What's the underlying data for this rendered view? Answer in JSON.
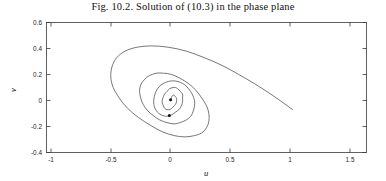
{
  "figure": {
    "title": "Fig. 10.2.  Solution of (10.3) in the phase plane",
    "xlabel": "u",
    "ylabel": "v"
  },
  "axes": {
    "x_ticks": [
      "-1",
      "-0.5",
      "0",
      "0.5",
      "1",
      "1.5"
    ],
    "y_ticks": [
      "0.6",
      "0.4",
      "0.2",
      "0",
      "-0.2",
      "-0.4"
    ]
  },
  "chart_data": {
    "type": "line",
    "title": "Fig. 10.2.  Solution of (10.3) in the phase plane",
    "xlabel": "u",
    "ylabel": "v",
    "xlim": [
      -1.1,
      1.6
    ],
    "ylim": [
      -0.45,
      0.6
    ],
    "grid": false,
    "legend": "none",
    "xticks": [
      -1,
      -0.5,
      0,
      0.5,
      1,
      1.5
    ],
    "yticks": [
      0.6,
      0.4,
      0.2,
      0,
      -0.2,
      -0.4
    ],
    "series": [
      {
        "name": "phase-plane trajectory",
        "description": "inward spiral orbit converging to the equilibrium at the origin",
        "x": [
          1.02,
          0.93,
          0.82,
          0.7,
          0.57,
          0.43,
          0.28,
          0.13,
          -0.02,
          -0.16,
          -0.28,
          -0.38,
          -0.45,
          -0.49,
          -0.5,
          -0.48,
          -0.43,
          -0.36,
          -0.27,
          -0.17,
          -0.07,
          0.03,
          0.12,
          0.2,
          0.26,
          0.3,
          0.32,
          0.32,
          0.3,
          0.26,
          0.21,
          0.15,
          0.08,
          0.01,
          -0.06,
          -0.12,
          -0.18,
          -0.22,
          -0.25,
          -0.26,
          -0.25,
          -0.23,
          -0.19,
          -0.14,
          -0.09,
          -0.03,
          0.03,
          0.08,
          0.13,
          0.17,
          0.19,
          0.2,
          0.2,
          0.18,
          0.15,
          0.12,
          0.08,
          0.04,
          0.0,
          -0.04,
          -0.08,
          -0.11,
          -0.13,
          -0.14,
          -0.14,
          -0.13,
          -0.11,
          -0.08,
          -0.05,
          -0.02,
          0.01,
          0.04,
          0.07,
          0.09,
          0.1,
          0.1,
          0.1,
          0.08,
          0.06,
          0.04,
          0.02,
          -0.01,
          -0.03,
          -0.05,
          -0.06,
          -0.07,
          -0.07,
          -0.06,
          -0.05,
          -0.03,
          -0.01,
          0.01,
          0.02,
          0.04,
          0.05,
          0.05,
          0.05,
          0.04,
          0.03,
          0.02,
          0.01,
          0.0
        ],
        "y": [
          -0.07,
          -0.01,
          0.06,
          0.13,
          0.2,
          0.27,
          0.33,
          0.38,
          0.41,
          0.42,
          0.41,
          0.38,
          0.33,
          0.26,
          0.18,
          0.1,
          0.02,
          -0.06,
          -0.13,
          -0.19,
          -0.24,
          -0.27,
          -0.28,
          -0.27,
          -0.25,
          -0.21,
          -0.16,
          -0.1,
          -0.04,
          0.02,
          0.08,
          0.13,
          0.17,
          0.2,
          0.21,
          0.21,
          0.19,
          0.16,
          0.12,
          0.07,
          0.02,
          -0.03,
          -0.08,
          -0.12,
          -0.15,
          -0.17,
          -0.18,
          -0.17,
          -0.15,
          -0.12,
          -0.08,
          -0.04,
          0.0,
          0.05,
          0.09,
          0.12,
          0.14,
          0.15,
          0.15,
          0.14,
          0.12,
          0.09,
          0.05,
          0.01,
          -0.03,
          -0.06,
          -0.09,
          -0.11,
          -0.12,
          -0.12,
          -0.11,
          -0.09,
          -0.07,
          -0.04,
          -0.01,
          0.02,
          0.05,
          0.07,
          0.09,
          0.1,
          0.1,
          0.09,
          0.07,
          0.05,
          0.03,
          0.0,
          -0.02,
          -0.04,
          -0.06,
          -0.07,
          -0.07,
          -0.06,
          -0.05,
          -0.03,
          -0.01,
          0.01,
          0.02,
          0.03,
          0.04,
          0.04,
          0.03,
          0.0
        ]
      }
    ],
    "markers": [
      {
        "name": "equilibrium-point",
        "x": 0.0,
        "y": 0.005,
        "style": "dot"
      },
      {
        "name": "trajectory-marker",
        "x": -0.01,
        "y": -0.115,
        "style": "dot"
      }
    ]
  }
}
